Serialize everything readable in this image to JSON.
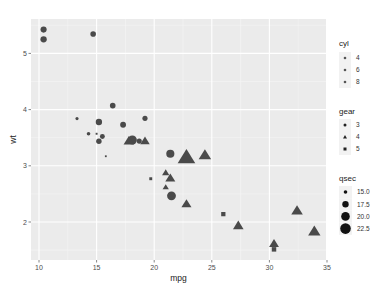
{
  "chart_data": {
    "type": "scatter",
    "title": "",
    "xlabel": "mpg",
    "ylabel": "wt",
    "xlim": [
      9.4,
      35.0
    ],
    "ylim": [
      1.35,
      5.6
    ],
    "x_ticks": [
      10,
      15,
      20,
      25,
      30,
      35
    ],
    "y_ticks": [
      2,
      3,
      4,
      5
    ],
    "grid": true,
    "legend_position": "right",
    "legends": [
      {
        "title": "cyl",
        "type": "color",
        "entries": [
          "4",
          "6",
          "8"
        ]
      },
      {
        "title": "gear",
        "type": "shape",
        "entries": [
          {
            "label": "3",
            "shape": "circle"
          },
          {
            "label": "4",
            "shape": "triangle"
          },
          {
            "label": "5",
            "shape": "square"
          }
        ]
      },
      {
        "title": "qsec",
        "type": "size",
        "entries": [
          "15.0",
          "17.5",
          "20.0",
          "22.5"
        ]
      }
    ],
    "points": [
      {
        "mpg": 21.0,
        "wt": 2.62,
        "gear": 4,
        "qsec": 16.46
      },
      {
        "mpg": 21.0,
        "wt": 2.875,
        "gear": 4,
        "qsec": 17.02
      },
      {
        "mpg": 22.8,
        "wt": 2.32,
        "gear": 4,
        "qsec": 18.61
      },
      {
        "mpg": 21.4,
        "wt": 3.215,
        "gear": 3,
        "qsec": 19.44
      },
      {
        "mpg": 18.7,
        "wt": 3.44,
        "gear": 3,
        "qsec": 17.02
      },
      {
        "mpg": 18.1,
        "wt": 3.46,
        "gear": 3,
        "qsec": 20.22
      },
      {
        "mpg": 14.3,
        "wt": 3.57,
        "gear": 3,
        "qsec": 15.84
      },
      {
        "mpg": 24.4,
        "wt": 3.19,
        "gear": 4,
        "qsec": 20.0
      },
      {
        "mpg": 22.8,
        "wt": 3.15,
        "gear": 4,
        "qsec": 22.9
      },
      {
        "mpg": 19.2,
        "wt": 3.44,
        "gear": 4,
        "qsec": 18.3
      },
      {
        "mpg": 17.8,
        "wt": 3.44,
        "gear": 4,
        "qsec": 18.9
      },
      {
        "mpg": 16.4,
        "wt": 4.07,
        "gear": 3,
        "qsec": 17.4
      },
      {
        "mpg": 17.3,
        "wt": 3.73,
        "gear": 3,
        "qsec": 17.6
      },
      {
        "mpg": 15.2,
        "wt": 3.78,
        "gear": 3,
        "qsec": 18.0
      },
      {
        "mpg": 10.4,
        "wt": 5.25,
        "gear": 3,
        "qsec": 17.98
      },
      {
        "mpg": 10.4,
        "wt": 5.424,
        "gear": 3,
        "qsec": 17.82
      },
      {
        "mpg": 14.7,
        "wt": 5.345,
        "gear": 3,
        "qsec": 17.42
      },
      {
        "mpg": 32.4,
        "wt": 2.2,
        "gear": 4,
        "qsec": 19.47
      },
      {
        "mpg": 30.4,
        "wt": 1.615,
        "gear": 4,
        "qsec": 18.52
      },
      {
        "mpg": 33.9,
        "wt": 1.835,
        "gear": 4,
        "qsec": 19.9
      },
      {
        "mpg": 21.5,
        "wt": 2.465,
        "gear": 3,
        "qsec": 20.01
      },
      {
        "mpg": 15.5,
        "wt": 3.52,
        "gear": 3,
        "qsec": 16.87
      },
      {
        "mpg": 15.2,
        "wt": 3.435,
        "gear": 3,
        "qsec": 17.3
      },
      {
        "mpg": 13.3,
        "wt": 3.84,
        "gear": 3,
        "qsec": 15.41
      },
      {
        "mpg": 19.2,
        "wt": 3.845,
        "gear": 3,
        "qsec": 17.05
      },
      {
        "mpg": 27.3,
        "wt": 1.935,
        "gear": 4,
        "qsec": 18.9
      },
      {
        "mpg": 26.0,
        "wt": 2.14,
        "gear": 5,
        "qsec": 16.7
      },
      {
        "mpg": 30.4,
        "wt": 1.513,
        "gear": 5,
        "qsec": 16.9
      },
      {
        "mpg": 15.8,
        "wt": 3.17,
        "gear": 5,
        "qsec": 14.5
      },
      {
        "mpg": 19.7,
        "wt": 2.77,
        "gear": 5,
        "qsec": 15.5
      },
      {
        "mpg": 15.0,
        "wt": 3.57,
        "gear": 5,
        "qsec": 14.6
      },
      {
        "mpg": 21.4,
        "wt": 2.78,
        "gear": 4,
        "qsec": 18.6
      }
    ],
    "colors": {
      "panel_bg": "#ebebeb",
      "grid_major": "#ffffff",
      "point_fill": "#4a4a4a",
      "legend_key_bg": "#f2f2f2"
    }
  }
}
